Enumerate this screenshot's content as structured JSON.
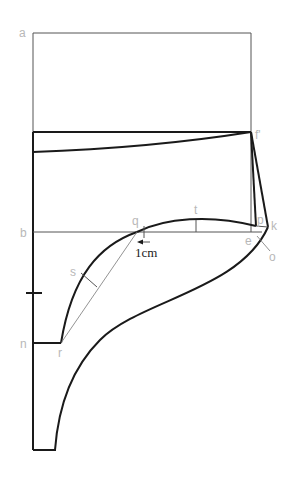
{
  "diagram": {
    "colors": {
      "line": "#1a1a1a",
      "guide": "#555555",
      "label": "#b8b8b8",
      "annotation": "#222222"
    },
    "points": {
      "a": "a",
      "b": "b",
      "n": "n",
      "r": "r",
      "s": "s",
      "q": "q",
      "t": "t",
      "e": "e",
      "p": "p",
      "k": "k",
      "o": "o",
      "f_prime": "f'"
    },
    "annotations": {
      "offset": "1cm"
    }
  }
}
